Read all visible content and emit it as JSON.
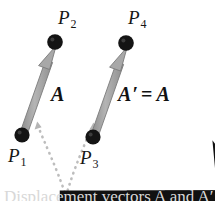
{
  "figure": {
    "background_color": "#ffffff",
    "arrow_color": "#a0a0a0",
    "arrow_outline_color": "#6f6f6f",
    "dot_color": "#111111",
    "dotted_path_color": "#b9b9b9",
    "text_color": "#151515"
  },
  "points": [
    {
      "id": "P1",
      "base": "P",
      "sub": "1",
      "x": 22,
      "y": 135,
      "label_x": 8,
      "label_y": 146
    },
    {
      "id": "P2",
      "base": "P",
      "sub": "2",
      "x": 55,
      "y": 42,
      "label_x": 58,
      "label_y": 8
    },
    {
      "id": "P3",
      "base": "P",
      "sub": "3",
      "x": 93,
      "y": 137,
      "label_x": 80,
      "label_y": 148
    },
    {
      "id": "P4",
      "base": "P",
      "sub": "4",
      "x": 126,
      "y": 43,
      "label_x": 128,
      "label_y": 8
    }
  ],
  "vectors": [
    {
      "id": "A",
      "from": "P1",
      "to": "P2",
      "label_x": 50,
      "label_y": 84,
      "symbol": "A",
      "prime": "",
      "equals": "",
      "equals_symbol": ""
    },
    {
      "id": "Aprime",
      "from": "P3",
      "to": "P4",
      "label_x": 117,
      "label_y": 84,
      "symbol": "A",
      "prime": "′",
      "equals": "=",
      "equals_symbol": "A"
    }
  ],
  "dotted_path": {
    "name": "displacement-dotted-path",
    "description": "V-shaped dotted guide from vector A tail region down and up to vector A-prime tail region",
    "arrowheads": 2
  },
  "caption": {
    "text": "Displacement vectors A and A′",
    "clipped": true
  }
}
